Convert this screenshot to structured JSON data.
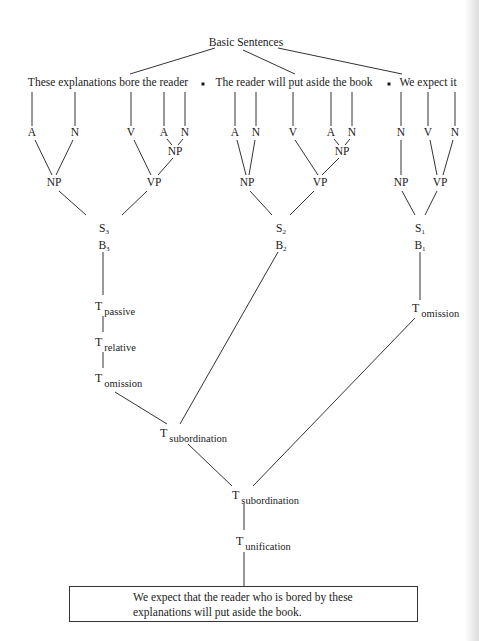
{
  "title": "Basic Sentences",
  "basic_sentences": [
    {
      "id": "s3",
      "text": "These explanations bore the reader"
    },
    {
      "id": "s2",
      "text": "The reader will put aside the book"
    },
    {
      "id": "s1",
      "text": "We expect it"
    }
  ],
  "separator_glyph": "•",
  "trees": {
    "s3": {
      "leaves": [
        "A",
        "N",
        "V",
        "A",
        "N"
      ],
      "inner_np": "NP",
      "np": "NP",
      "vp": "VP",
      "s_label": "S",
      "s_index": "3",
      "b_label": "B",
      "b_index": "3"
    },
    "s2": {
      "leaves": [
        "A",
        "N",
        "V",
        "A",
        "N"
      ],
      "inner_np": "NP",
      "np": "NP",
      "vp": "VP",
      "s_label": "S",
      "s_index": "2",
      "b_label": "B",
      "b_index": "2"
    },
    "s1": {
      "leaves": [
        "N",
        "V",
        "N"
      ],
      "np": "NP",
      "vp": "VP",
      "s_label": "S",
      "s_index": "1",
      "b_label": "B",
      "b_index": "1"
    }
  },
  "transformations": {
    "t_symbol": "T",
    "passive": "passive",
    "relative": "relative",
    "omission_left": "omission",
    "omission_right": "omission",
    "subordination_1": "subordination",
    "subordination_2": "subordination",
    "unification": "unification"
  },
  "result": {
    "line1": "We expect that the reader who is bored by these",
    "line2": "explanations will put aside the book."
  }
}
